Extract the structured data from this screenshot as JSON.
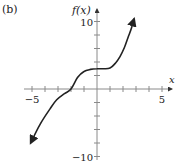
{
  "panel_label": "(b)",
  "chart_data": {
    "type": "line",
    "title": "",
    "panel_label": "(b)",
    "xlabel": "x",
    "ylabel": "f(x)",
    "xlim": [
      -5.5,
      6.2
    ],
    "ylim": [
      -10,
      11
    ],
    "x_ticks": [
      -5,
      -4,
      -3,
      -2,
      -1,
      0,
      1,
      2,
      3,
      4,
      5
    ],
    "x_tick_labels": {
      "-5": "−5",
      "5": "5"
    },
    "y_ticks": [
      -10,
      -8,
      -6,
      -4,
      -2,
      0,
      2,
      4,
      6,
      8,
      10
    ],
    "y_tick_labels": {
      "10": "10",
      "-10": "−10"
    },
    "grid": false,
    "legend": null,
    "arrows_at_ends": true,
    "series": [
      {
        "name": "f(x)",
        "x": [
          -5.1,
          -4.4,
          -3.6,
          -3.1,
          -2.5,
          -2.0,
          -1.5,
          -1.0,
          -0.5,
          0.0,
          0.5,
          1.0,
          1.4,
          1.77,
          2.1,
          2.4,
          2.65,
          2.85
        ],
        "y": [
          -8.0,
          -5.3,
          -2.9,
          -1.6,
          -0.7,
          0.0,
          1.7,
          2.6,
          2.9,
          3.0,
          3.0,
          3.1,
          3.8,
          4.8,
          6.1,
          7.7,
          9.0,
          10.4
        ]
      }
    ]
  },
  "style": {
    "axis_color": "#8a8a8a",
    "curve_color": "#222222",
    "text_color": "#222222"
  }
}
